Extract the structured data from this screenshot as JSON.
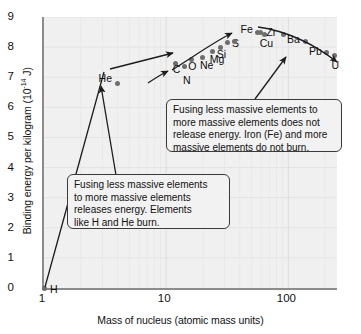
{
  "chart_data": {
    "type": "scatter",
    "title": "",
    "xlabel": "Mass of nucleus (atomic mass units)",
    "ylabel": "Binding energy per kilogram (10⁻¹⁴ J)",
    "ylabel_text": "Binding energy per kilogram (10",
    "ylabel_sup": "-14",
    "ylabel_tail": " J)",
    "xscale": "log",
    "yscale": "linear",
    "xlim": [
      1,
      250
    ],
    "ylim": [
      0,
      9
    ],
    "grid": true,
    "legend": "none",
    "xticks": [
      "1",
      "10",
      "100"
    ],
    "xtick_values": [
      1,
      10,
      100
    ],
    "yticks": [
      "0",
      "1",
      "2",
      "3",
      "4",
      "5",
      "6",
      "7",
      "8",
      "9"
    ],
    "ytick_values": [
      0,
      1,
      2,
      3,
      4,
      5,
      6,
      7,
      8,
      9
    ],
    "points": [
      {
        "label": "H",
        "x": 1,
        "y": 0.0,
        "lx": 6,
        "ly": 2,
        "show_label": true
      },
      {
        "label": "He",
        "x": 4,
        "y": 6.8,
        "lx": -19,
        "ly": -4,
        "show_label": true
      },
      {
        "label": "C",
        "x": 12,
        "y": 7.45,
        "lx": -3,
        "ly": 6,
        "show_label": true
      },
      {
        "label": "N",
        "x": 14,
        "y": 7.35,
        "lx": -1,
        "ly": 14,
        "show_label": true
      },
      {
        "label": "O",
        "x": 16,
        "y": 7.6,
        "lx": -3,
        "ly": 8,
        "show_label": true
      },
      {
        "label": "Ne",
        "x": 20,
        "y": 7.65,
        "lx": -3,
        "ly": 8,
        "show_label": true
      },
      {
        "label": "Mg",
        "x": 24,
        "y": 7.85,
        "lx": -3,
        "ly": 8,
        "show_label": true
      },
      {
        "label": "Si",
        "x": 28,
        "y": 8.0,
        "lx": -4,
        "ly": 8,
        "show_label": true
      },
      {
        "label": "S",
        "x": 32,
        "y": 8.15,
        "lx": 4,
        "ly": 1,
        "show_label": true
      },
      {
        "label": "",
        "x": 36,
        "y": 8.2,
        "lx": 0,
        "ly": 0,
        "show_label": false
      },
      {
        "label": "Fe",
        "x": 56,
        "y": 8.5,
        "lx": -17,
        "ly": -2,
        "show_label": true
      },
      {
        "label": "",
        "x": 59,
        "y": 8.48,
        "lx": 0,
        "ly": 0,
        "show_label": false
      },
      {
        "label": "Cu",
        "x": 64,
        "y": 8.42,
        "lx": -5,
        "ly": 10,
        "show_label": true
      },
      {
        "label": "Zr",
        "x": 91,
        "y": 8.42,
        "lx": -17,
        "ly": -1,
        "show_label": true
      },
      {
        "label": "Ba",
        "x": 137,
        "y": 8.2,
        "lx": -18,
        "ly": -1,
        "show_label": true
      },
      {
        "label": "Pb",
        "x": 207,
        "y": 7.82,
        "lx": -18,
        "ly": -1,
        "show_label": true
      },
      {
        "label": "U",
        "x": 238,
        "y": 7.72,
        "lx": -3,
        "ly": 10,
        "show_label": true
      }
    ],
    "annotations": [
      {
        "id": "callout-top",
        "lines": [
          "Fusing less massive elements to",
          "more massive elements does not",
          "release energy. Iron (Fe) and more",
          "massive elements do not burn."
        ]
      },
      {
        "id": "callout-bottom",
        "lines": [
          "Fusing less massive elements",
          "to more massive elements",
          "releases energy. Elements",
          "like H and He burn."
        ]
      }
    ],
    "arrows": [
      {
        "name": "arrow-callout-bottom-to-He",
        "from": [
          118,
          201
        ],
        "to": [
          100,
          90
        ]
      },
      {
        "name": "arrow-callout-top-to-Ba",
        "from": [
          258,
          101
        ],
        "to": [
          288,
          57
        ]
      },
      {
        "name": "arrow-curve-left-start",
        "from": [
          152,
          78
        ],
        "to": [
          168,
          70
        ]
      },
      {
        "name": "arrow-curve-to-He",
        "from": [
          110,
          67
        ],
        "to": [
          176,
          52
        ]
      },
      {
        "name": "arrow-curve-peak",
        "from": [
          200,
          60
        ],
        "to": [
          258,
          30
        ]
      },
      {
        "name": "arrow-curve-right-end",
        "from": [
          300,
          40
        ],
        "to": [
          340,
          60
        ]
      }
    ],
    "colors": {
      "plot_background": "#f0f0f0",
      "axis": "#8c8c8c",
      "point": "#6e6e6e",
      "text": "#111111",
      "callout_border": "#3a3a3a",
      "callout_background": "#f2f2f2",
      "grid": "#e2e2e2"
    }
  }
}
